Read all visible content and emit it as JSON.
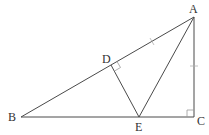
{
  "diagram": {
    "type": "geometry",
    "points": {
      "A": {
        "label": "A",
        "x": 194,
        "y": 17
      },
      "B": {
        "label": "B",
        "x": 21,
        "y": 117
      },
      "C": {
        "label": "C",
        "x": 194,
        "y": 117
      },
      "D": {
        "label": "D",
        "x": 111,
        "y": 65
      },
      "E": {
        "label": "E",
        "x": 139,
        "y": 117
      }
    },
    "segments": [
      "AB",
      "BC",
      "CA",
      "DE",
      "AE"
    ],
    "right_angles": [
      "C",
      "D"
    ],
    "equal_marks": [
      "AD",
      "AC"
    ],
    "colors": {
      "line": "#4a4a4a",
      "label": "#333333",
      "background": "#ffffff"
    }
  }
}
